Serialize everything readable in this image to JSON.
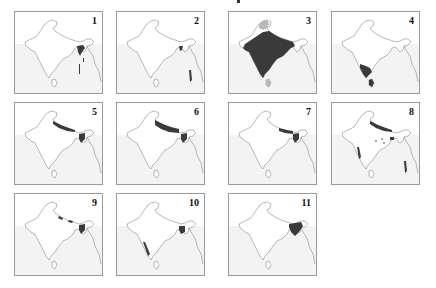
{
  "figure": {
    "type": "multi-panel distribution maps of the Indian subcontinent",
    "colors": {
      "land": "#ffffff",
      "sea": "#f3f3f3",
      "outline": "#8a8a8a",
      "range": "#3a3a3a",
      "alt_range": "#b8b8b8",
      "border": "#9a9a9a"
    },
    "panels": [
      {
        "label": "1",
        "regions": [
          "northeast-bengal",
          "east-coast-strip"
        ]
      },
      {
        "label": "2",
        "regions": [
          "bengal-small",
          "andaman-islands"
        ]
      },
      {
        "label": "3",
        "regions": [
          "most-of-india",
          "kashmir-light",
          "sri-lanka-light"
        ]
      },
      {
        "label": "4",
        "regions": [
          "south-india",
          "sri-lanka"
        ]
      },
      {
        "label": "5",
        "regions": [
          "himalaya-belt",
          "northeast"
        ]
      },
      {
        "label": "6",
        "regions": [
          "himalaya-belt-wide",
          "northeast"
        ]
      },
      {
        "label": "7",
        "regions": [
          "himalaya-east",
          "northeast"
        ]
      },
      {
        "label": "8",
        "regions": [
          "himalaya-belt",
          "central-spots",
          "western-ghats",
          "andaman-islands"
        ]
      },
      {
        "label": "9",
        "regions": [
          "himalaya-spots",
          "northeast"
        ]
      },
      {
        "label": "10",
        "regions": [
          "northeast-hills",
          "western-ghats-south"
        ]
      },
      {
        "label": "11",
        "regions": [
          "northeast-large"
        ]
      }
    ]
  }
}
